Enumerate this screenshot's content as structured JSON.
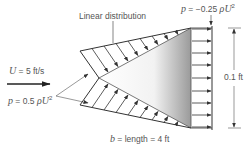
{
  "diagram": {
    "title_label": "Linear distribution",
    "top_pressure": {
      "prefix": "p",
      "eq": " = −0.25 ",
      "rho": "ρ",
      "U": "U",
      "exp": "2"
    },
    "freestream": {
      "symbol": "U",
      "value": " = 5 ft/s"
    },
    "tip_pressure": {
      "prefix": "p",
      "eq": " = 0.5 ",
      "rho": "ρ",
      "U": "U",
      "exp": "2"
    },
    "height_label": "0.1 ft",
    "length_label": {
      "symbol": "b",
      "text": " = length = 4 ft"
    },
    "colors": {
      "line": "#333333",
      "text": "#555555",
      "shade_dark": "#9a9a9a",
      "shade_light": "#ffffff"
    }
  }
}
